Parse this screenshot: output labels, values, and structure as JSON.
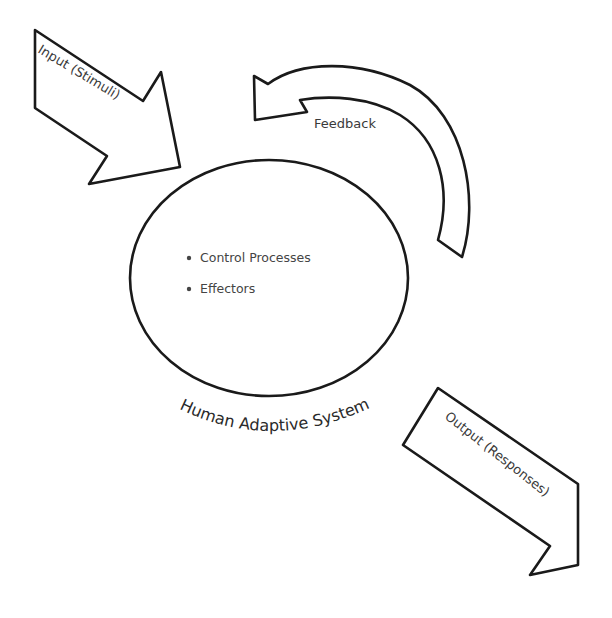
{
  "diagram": {
    "input_arrow": {
      "label": "Input (Stimuli)",
      "direction": "down-right",
      "target": "human-adaptive-system"
    },
    "feedback_arrow": {
      "label": "Feedback",
      "direction": "curved-counterclockwise"
    },
    "system": {
      "label": "Human Adaptive System",
      "shape": "circle",
      "bullets": [
        "Control Processes",
        "Effectors"
      ]
    },
    "output_arrow": {
      "label": "Output (Responses)",
      "direction": "down-right"
    },
    "colors": {
      "stroke": "#1a1a1a",
      "fill": "#ffffff",
      "text": "#3a3a3a"
    }
  }
}
